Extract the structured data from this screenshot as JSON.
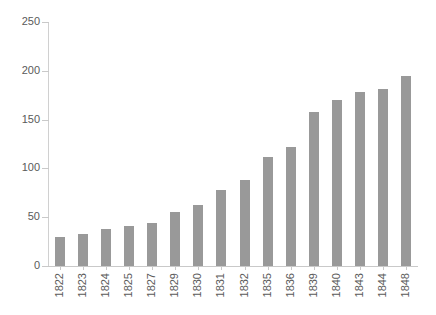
{
  "chart_data": {
    "type": "bar",
    "title": "",
    "subtitle": "",
    "xlabel": "",
    "ylabel": "",
    "ylim": [
      0,
      250
    ],
    "y_ticks": [
      0,
      50,
      100,
      150,
      200,
      250
    ],
    "grid": false,
    "legend": false,
    "bar_color": "#999999",
    "axis_color": "#c9c9c9",
    "text_color": "#5a5a5a",
    "categories": [
      "1822",
      "1823",
      "1824",
      "1825",
      "1827",
      "1829",
      "1830",
      "1831",
      "1832",
      "1835",
      "1836",
      "1839",
      "1840",
      "1843",
      "1844",
      "1848"
    ],
    "values": [
      30,
      33,
      38,
      41,
      44,
      55,
      63,
      78,
      88,
      112,
      122,
      158,
      170,
      178,
      181,
      195
    ]
  }
}
